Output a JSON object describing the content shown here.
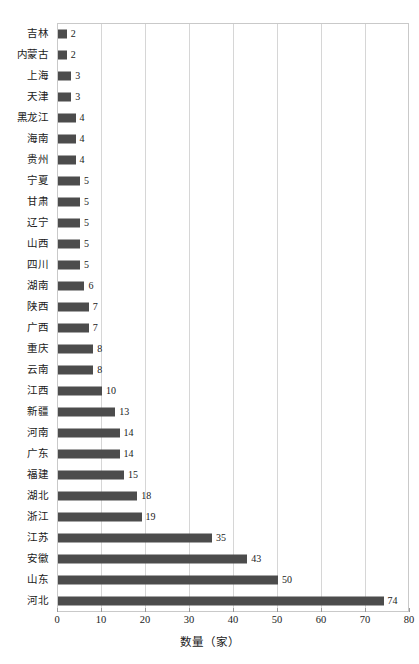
{
  "chart_data": {
    "type": "bar",
    "orientation": "horizontal",
    "title": "",
    "xlabel": "数量（家）",
    "ylabel": "",
    "xlim": [
      0,
      80
    ],
    "xticks": [
      0,
      10,
      20,
      30,
      40,
      50,
      60,
      70,
      80
    ],
    "grid": "vertical",
    "legend": "none",
    "bar_color": "#4c4c4c",
    "grid_color": "#d6d6d6",
    "frame_color": "#c9c9c9",
    "categories": [
      "吉林",
      "内蒙古",
      "上海",
      "天津",
      "黑龙江",
      "海南",
      "贵州",
      "宁夏",
      "甘肃",
      "辽宁",
      "山西",
      "四川",
      "湖南",
      "陕西",
      "广西",
      "重庆",
      "云南",
      "江西",
      "新疆",
      "河南",
      "广东",
      "福建",
      "湖北",
      "浙江",
      "江苏",
      "安徽",
      "山东",
      "河北"
    ],
    "values": [
      2,
      2,
      3,
      3,
      4,
      4,
      4,
      5,
      5,
      5,
      5,
      5,
      6,
      7,
      7,
      8,
      8,
      10,
      13,
      14,
      14,
      15,
      18,
      19,
      35,
      43,
      50,
      74
    ],
    "value_labels": [
      "2",
      "2",
      "3",
      "3",
      "4",
      "4",
      "4",
      "5",
      "5",
      "5",
      "5",
      "5",
      "6",
      "7",
      "7",
      "8",
      "8",
      "10",
      "13",
      "14",
      "14",
      "15",
      "18",
      "19",
      "35",
      "43",
      "50",
      "74"
    ]
  }
}
